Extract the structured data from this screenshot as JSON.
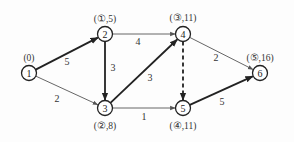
{
  "diagram": {
    "type": "directed-network-shortest-path",
    "nodes": [
      {
        "id": "1",
        "x": 29,
        "y": 73,
        "label": "(0)",
        "label_x": 29,
        "label_y": 58
      },
      {
        "id": "2",
        "x": 105,
        "y": 34,
        "label": "(①,5)",
        "label_x": 105,
        "label_y": 19
      },
      {
        "id": "3",
        "x": 105,
        "y": 108,
        "label": "(②,8)",
        "label_x": 105,
        "label_y": 126
      },
      {
        "id": "4",
        "x": 183,
        "y": 34,
        "label": "(③,11)",
        "label_x": 183,
        "label_y": 18
      },
      {
        "id": "5",
        "x": 183,
        "y": 108,
        "label": "(④,11)",
        "label_x": 183,
        "label_y": 126
      },
      {
        "id": "6",
        "x": 260,
        "y": 73,
        "label": "(⑤,16)",
        "label_x": 260,
        "label_y": 58
      }
    ],
    "edges": [
      {
        "from": "1",
        "to": "2",
        "weight": "5",
        "style": "bold",
        "label_x": 67,
        "label_y": 61
      },
      {
        "from": "1",
        "to": "3",
        "weight": "2",
        "style": "thin",
        "label_x": 57,
        "label_y": 98
      },
      {
        "from": "2",
        "to": "3",
        "weight": "3",
        "style": "bold",
        "label_x": 113,
        "label_y": 67
      },
      {
        "from": "2",
        "to": "4",
        "weight": "4",
        "style": "thin",
        "label_x": 138,
        "label_y": 41
      },
      {
        "from": "3",
        "to": "4",
        "weight": "3",
        "style": "bold",
        "label_x": 150,
        "label_y": 77
      },
      {
        "from": "3",
        "to": "5",
        "weight": "1",
        "style": "thin",
        "label_x": 144,
        "label_y": 116
      },
      {
        "from": "4",
        "to": "5",
        "weight": "",
        "style": "dashed",
        "label_x": 0,
        "label_y": 0
      },
      {
        "from": "4",
        "to": "6",
        "weight": "2",
        "style": "thin",
        "label_x": 216,
        "label_y": 57
      },
      {
        "from": "5",
        "to": "6",
        "weight": "5",
        "style": "bold",
        "label_x": 222,
        "label_y": 101
      }
    ]
  }
}
